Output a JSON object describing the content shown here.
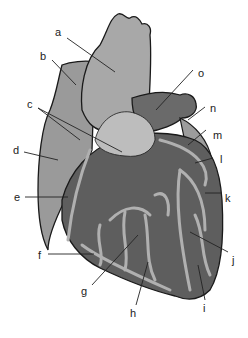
{
  "diagram": {
    "colors": {
      "outline": "#1a1a1a",
      "atrium_light": "#9a9a9a",
      "aorta": "#a4a4a4",
      "pulmonary_trunk_light": "#bdbdbd",
      "ventricle_dark": "#5e5e5e",
      "vessel": "#b0b0b0",
      "pulmonary_dark": "#6a6a6a",
      "leader_line": "#222222"
    },
    "labels": [
      {
        "id": "a",
        "text": "a",
        "x": 55,
        "y": 27
      },
      {
        "id": "b",
        "text": "b",
        "x": 40,
        "y": 51
      },
      {
        "id": "c",
        "text": "c",
        "x": 27,
        "y": 99
      },
      {
        "id": "d",
        "text": "d",
        "x": 13,
        "y": 145
      },
      {
        "id": "e",
        "text": "e",
        "x": 14,
        "y": 192
      },
      {
        "id": "f",
        "text": "f",
        "x": 38,
        "y": 250
      },
      {
        "id": "g",
        "text": "g",
        "x": 81,
        "y": 286
      },
      {
        "id": "h",
        "text": "h",
        "x": 130,
        "y": 308
      },
      {
        "id": "i",
        "text": "i",
        "x": 203,
        "y": 303
      },
      {
        "id": "j",
        "text": "j",
        "x": 232,
        "y": 255
      },
      {
        "id": "k",
        "text": "k",
        "x": 225,
        "y": 193
      },
      {
        "id": "l",
        "text": "l",
        "x": 220,
        "y": 154
      },
      {
        "id": "m",
        "text": "m",
        "x": 213,
        "y": 130
      },
      {
        "id": "n",
        "text": "n",
        "x": 210,
        "y": 103
      },
      {
        "id": "o",
        "text": "o",
        "x": 198,
        "y": 68
      }
    ]
  }
}
